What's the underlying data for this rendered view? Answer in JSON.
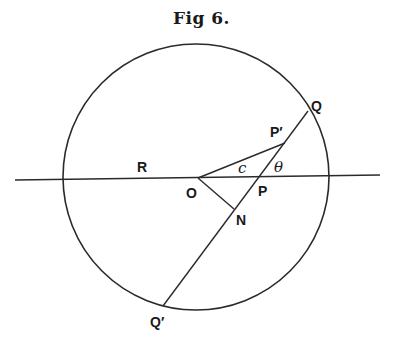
{
  "figure": {
    "title": "Fig 6.",
    "labels": {
      "R": "R",
      "O": "O",
      "P": "P",
      "N": "N",
      "P_prime": "P′",
      "Q": "Q",
      "Q_prime": "Q′",
      "c": "c",
      "theta": "θ"
    },
    "colors": {
      "stroke": "#2a2a2a",
      "text": "#1a1a1a",
      "background": "#ffffff"
    }
  }
}
